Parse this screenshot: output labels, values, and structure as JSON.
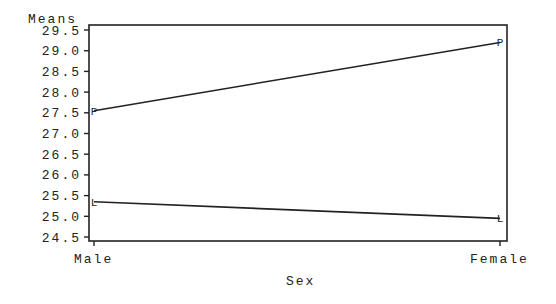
{
  "chart_data": {
    "type": "line",
    "title": "",
    "xlabel": "Sex",
    "ylabel": "Means",
    "categories": [
      "Male",
      "Female"
    ],
    "series": [
      {
        "name": "P",
        "marker": "P",
        "values": [
          27.55,
          29.2
        ]
      },
      {
        "name": "L",
        "marker": "L",
        "values": [
          25.35,
          24.95
        ]
      }
    ],
    "yticks": [
      "24.5",
      "25.0",
      "25.5",
      "26.0",
      "26.5",
      "27.0",
      "27.5",
      "28.0",
      "28.5",
      "29.0",
      "29.5"
    ],
    "ylim": [
      24.5,
      29.5
    ],
    "grid": false,
    "legend": "none (series marked by letters P and L)"
  },
  "labels": {
    "ylabel": "Means",
    "xlabel": "Sex",
    "x_male": "Male",
    "x_female": "Female"
  }
}
